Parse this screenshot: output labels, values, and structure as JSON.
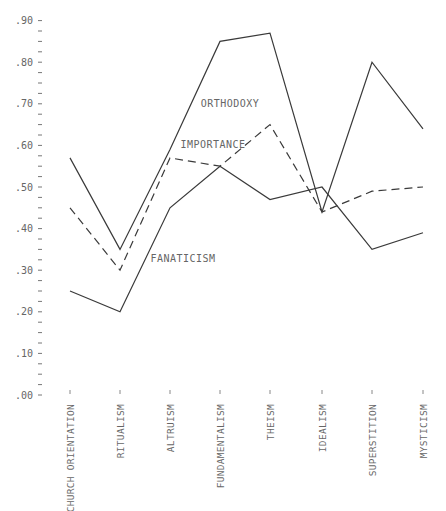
{
  "chart_data": {
    "type": "line",
    "title": "",
    "xlabel": "",
    "ylabel": "",
    "ylim": [
      0,
      0.9
    ],
    "grid": false,
    "legend": "inline labels",
    "y_ticks": [
      ".00",
      ".10",
      ".20",
      ".30",
      ".40",
      ".50",
      ".60",
      ".70",
      ".80",
      ".90"
    ],
    "categories": [
      "CHURCH ORIENTATION",
      "RITUALISM",
      "ALTRUISM",
      "FUNDAMENTALISM",
      "THEISM",
      "IDEALISM",
      "SUPERSTITION",
      "MYSTICISM"
    ],
    "series": [
      {
        "name": "ORTHODOXY",
        "style": "solid",
        "values": [
          0.57,
          0.35,
          0.59,
          0.85,
          0.87,
          0.44,
          0.8,
          0.64
        ]
      },
      {
        "name": "IMPORTANCE",
        "style": "dashed",
        "values": [
          0.45,
          0.3,
          0.57,
          0.55,
          0.65,
          0.44,
          0.49,
          0.5
        ]
      },
      {
        "name": "FANATICISM",
        "style": "solid",
        "values": [
          0.25,
          0.2,
          0.45,
          0.55,
          0.47,
          0.5,
          0.35,
          0.39
        ]
      }
    ],
    "annotations": [
      {
        "text": "ORTHODOXY",
        "x": 230,
        "y": 107
      },
      {
        "text": "IMPORTANCE",
        "x": 213,
        "y": 148
      },
      {
        "text": "FANATICISM",
        "x": 183,
        "y": 262
      }
    ]
  }
}
